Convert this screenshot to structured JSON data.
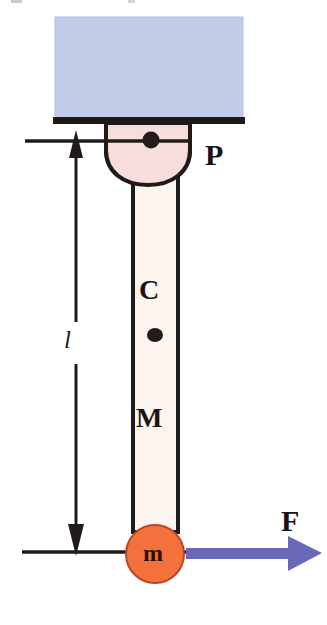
{
  "figure": {
    "type": "physics-free-body-diagram",
    "canvas": {
      "width": 327,
      "height": 625,
      "background": "#ffffff"
    }
  },
  "labels": {
    "pivot": "P",
    "center_of_mass": "C",
    "rod_mass": "M",
    "force": "F",
    "point_mass": "m",
    "length": "l"
  },
  "colors": {
    "ceiling_block_fill": "#c3cdea",
    "ceiling_block_edge": "#aab6dd",
    "support_bar": "#1d1a17",
    "pivot_fill": "#f7dedd",
    "rod_fill": "#fbf4ef",
    "outline": "#201b18",
    "mass_fill": "#f2713c",
    "mass_edge": "#b8472a",
    "force_arrow": "#6a68b8",
    "dimension_line": "#201b18",
    "text": "#1a1512"
  },
  "geometry": {
    "ceiling_block": {
      "x": 55,
      "y": 17,
      "width": 188,
      "height": 101
    },
    "support_bar": {
      "x": 53,
      "y": 117,
      "width": 192,
      "height": 7
    },
    "pivot_bowl": {
      "cx": 148,
      "top": 124,
      "half_width": 42,
      "bottom": 182
    },
    "pivot_dot": {
      "cx": 151,
      "cy": 140,
      "r": 8
    },
    "pivot_axle_line": {
      "x1": 25,
      "x2": 190,
      "y": 141
    },
    "rod": {
      "x": 133,
      "y": 160,
      "width": 45,
      "height": 370
    },
    "com_dot": {
      "cx": 155,
      "cy": 335,
      "r": 7
    },
    "point_mass": {
      "cx": 155,
      "cy": 554,
      "r": 29
    },
    "ground_line": {
      "x1": 22,
      "x2": 200,
      "y": 552
    },
    "dimension_arrow": {
      "x": 76,
      "y_top": 137,
      "y_bottom": 552
    },
    "force_arrow": {
      "x1": 186,
      "x2": 322,
      "y": 553,
      "thickness": 11
    }
  },
  "annotations": {
    "length_symbol_position": "left-of-rod",
    "force_direction": "right",
    "dimension_double_arrow": "vertical-spanning-pivot-to-mass"
  }
}
